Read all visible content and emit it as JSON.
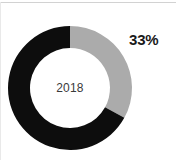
{
  "canvas": {
    "width": 176,
    "height": 160,
    "background": "#ffffff",
    "rule_color": "#d2d2d2"
  },
  "chart_data": {
    "type": "pie",
    "variant": "donut",
    "title": "",
    "subtitle": "",
    "xlabel": "",
    "ylabel": "",
    "center_label": "2018",
    "start_angle_deg": 0,
    "direction": "clockwise",
    "inner_radius_ratio": 0.645,
    "outer_radius_px": 62,
    "ring_thickness_px": 22,
    "legend": "none",
    "grid": false,
    "categories": [
      "Share",
      "Remainder"
    ],
    "values": [
      33,
      67
    ],
    "value_unit": "%",
    "colors": [
      "#ababab",
      "#0d0d0d"
    ],
    "data_labels": [
      {
        "series": "Share",
        "text": "33%",
        "value": 33,
        "color": "#1a1a1a",
        "position": "outside-right"
      }
    ],
    "slices": [
      {
        "name": "Share",
        "value": 33,
        "label": "33%",
        "color": "#ababab",
        "start_deg": 0,
        "end_deg": 118.8
      },
      {
        "name": "Remainder",
        "value": 67,
        "label": "",
        "color": "#0d0d0d",
        "start_deg": 118.8,
        "end_deg": 360
      }
    ]
  },
  "labels": {
    "percent": "33%",
    "year": "2018"
  }
}
